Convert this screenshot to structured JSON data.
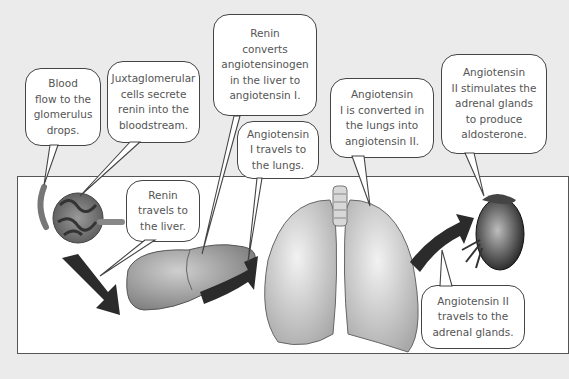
{
  "diagram": {
    "organs": [
      {
        "id": "glomerulus",
        "label": "glomerulus"
      },
      {
        "id": "liver",
        "label": "liver"
      },
      {
        "id": "lungs",
        "label": "lungs"
      },
      {
        "id": "adrenal",
        "label": "adrenal gland / kidney"
      }
    ],
    "bubbles": [
      {
        "id": "blood-flow",
        "lines": [
          "Blood",
          "flow to the",
          "glomerulus",
          "drops."
        ]
      },
      {
        "id": "juxtaglomerular",
        "lines": [
          "Juxtaglomerular",
          "cells secrete",
          "renin into the",
          "bloodstream."
        ]
      },
      {
        "id": "renin-liver",
        "lines": [
          "Renin",
          "travels to",
          "the liver."
        ]
      },
      {
        "id": "renin-converts",
        "lines": [
          "Renin",
          "converts",
          "angiotensinogen",
          "in the liver to",
          "angiotensin I."
        ]
      },
      {
        "id": "ang1-lungs",
        "lines": [
          "Angiotensin",
          "I travels to",
          "the lungs."
        ]
      },
      {
        "id": "ang1-converted",
        "lines": [
          "Angiotensin",
          "I is converted in",
          "the lungs into",
          "angiotensin II."
        ]
      },
      {
        "id": "ang2-stimulates",
        "lines": [
          "Angiotensin",
          "II stimulates the",
          "adrenal glands",
          "to produce",
          "aldosterone."
        ]
      },
      {
        "id": "ang2-travels",
        "lines": [
          "Angiotensin II",
          "travels to the",
          "adrenal glands."
        ]
      }
    ],
    "colors": {
      "background": "#ebebeb",
      "panel": "#ffffff",
      "arrow": "#2b2b2b",
      "text": "#555555"
    }
  }
}
